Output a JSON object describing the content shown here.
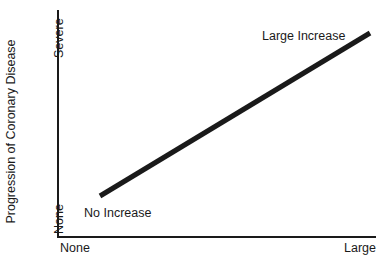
{
  "chart_data": {
    "type": "line",
    "title": "",
    "subtitle": "",
    "xlabel": "",
    "ylabel": "Progression of Coronary Disease",
    "x_tick_labels": [
      "None",
      "Large"
    ],
    "y_tick_labels": [
      "None",
      "Severe"
    ],
    "xlim": [
      "None",
      "Large"
    ],
    "ylim": [
      "None",
      "Severe"
    ],
    "grid": false,
    "legend": false,
    "legend_position": "none",
    "series": [
      {
        "name": "Progression trend",
        "color": "#1a1a1a",
        "line_width_px": 5,
        "points": [
          {
            "x": 0.13,
            "y": 0.18,
            "label": "No Increase"
          },
          {
            "x": 0.98,
            "y": 0.9,
            "label": "Large Increase"
          }
        ]
      }
    ],
    "annotations": [
      {
        "name": "no-increase",
        "text": "No Increase",
        "x": 0.13,
        "y": 0.18
      },
      {
        "name": "large-increase",
        "text": "Large Increase",
        "x": 0.8,
        "y": 0.92
      }
    ]
  },
  "axes": {
    "y_title": "Progression of Coronary Disease",
    "y_tick_top": "Severe",
    "y_tick_bottom": "None",
    "x_tick_left": "None",
    "x_tick_right": "Large"
  },
  "annotations": {
    "low": "No Increase",
    "high": "Large Increase"
  },
  "colors": {
    "background": "#ffffff",
    "axis": "#1a1a1a",
    "text": "#1a1a1a",
    "trend_line": "#1a1a1a"
  },
  "geometry": {
    "trend_x1": 100,
    "trend_y1": 196,
    "trend_x2": 370,
    "trend_y2": 33,
    "trend_width": 5
  }
}
